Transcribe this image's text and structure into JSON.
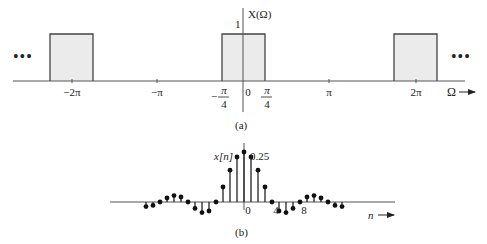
{
  "figure_a": {
    "ylabel": "X(Ω)",
    "xlabel": "Ω",
    "height_label": "1",
    "caption": "(a)",
    "ticks": [
      {
        "label": "−2π",
        "x": 72
      },
      {
        "label": "−π",
        "x": 157
      },
      {
        "label": "0",
        "x": 248
      },
      {
        "label": "π",
        "x": 329
      },
      {
        "label": "2π",
        "x": 416
      }
    ],
    "frac_ticks": [
      {
        "num": "π",
        "den": "4",
        "sign": "−",
        "x": 222
      },
      {
        "num": "π",
        "den": "4",
        "sign": "",
        "x": 265
      }
    ],
    "ellipsis_left": "•••",
    "ellipsis_right": "•••",
    "rect_fill": "#ebebeb",
    "line_color": "#444444"
  },
  "figure_b": {
    "ylabel": "x[n]",
    "xlabel": "n",
    "peak_label": "0.25",
    "caption": "(b)",
    "tick_labels": [
      {
        "label": "0",
        "n": 0
      },
      {
        "label": "4",
        "n": 4
      },
      {
        "label": "8",
        "n": 8
      }
    ]
  },
  "chart_data": [
    {
      "type": "line",
      "title": "(a)",
      "xlabel": "Ω",
      "ylabel": "X(Ω)",
      "description": "Periodic ideal lowpass spectrum, rectangular pulses of height 1 on |Ω|<π/4 repeating every 2π",
      "x_ticks": [
        "−2π",
        "−π",
        "−π/4",
        "0",
        "π/4",
        "π",
        "2π"
      ],
      "series": [
        {
          "name": "X(Ω)",
          "pulses": [
            {
              "center": "−2π",
              "from": "−2π−π/4",
              "to": "−2π+π/4",
              "height": 1
            },
            {
              "center": "0",
              "from": "−π/4",
              "to": "π/4",
              "height": 1
            },
            {
              "center": "2π",
              "from": "2π−π/4",
              "to": "2π+π/4",
              "height": 1
            }
          ]
        }
      ],
      "ylim": [
        0,
        1
      ]
    },
    {
      "type": "scatter",
      "title": "(b)",
      "xlabel": "n",
      "ylabel": "x[n]",
      "description": "Stem plot of x[n] = sin(πn/4)/(πn)",
      "x": [
        -14,
        -13,
        -12,
        -11,
        -10,
        -9,
        -8,
        -7,
        -6,
        -5,
        -4,
        -3,
        -2,
        -1,
        0,
        1,
        2,
        3,
        4,
        5,
        6,
        7,
        8,
        9,
        10,
        11,
        12,
        13,
        14
      ],
      "values": [
        -0.023,
        -0.017,
        0,
        0.02,
        0.032,
        0.025,
        0,
        -0.032,
        -0.053,
        -0.045,
        0,
        0.075,
        0.159,
        0.225,
        0.25,
        0.225,
        0.159,
        0.075,
        0,
        -0.045,
        -0.053,
        -0.032,
        0,
        0.025,
        0.032,
        0.02,
        0,
        -0.017,
        -0.023
      ],
      "x_tick_labels": [
        "0",
        "4",
        "8"
      ],
      "annotations": [
        "0.25"
      ]
    }
  ]
}
